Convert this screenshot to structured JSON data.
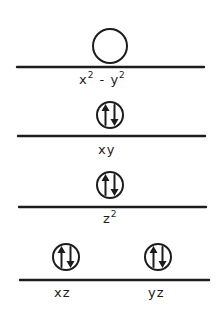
{
  "diagram": {
    "type": "d-orbital energy level diagram",
    "levels": [
      {
        "id": "x2-y2",
        "label_base_x": "x",
        "label_sup_x": "2",
        "label_minus": " - ",
        "label_base_y": "y",
        "label_sup_y": "2",
        "electrons": 0,
        "occupancy": "empty"
      },
      {
        "id": "xy",
        "label": "xy",
        "electrons": 2,
        "occupancy": "paired"
      },
      {
        "id": "z2",
        "label_base": "z",
        "label_sup": "2",
        "electrons": 2,
        "occupancy": "paired"
      },
      {
        "id": "xz",
        "label": "xz",
        "electrons": 2,
        "occupancy": "paired"
      },
      {
        "id": "yz",
        "label": "yz",
        "electrons": 2,
        "occupancy": "paired"
      }
    ],
    "colors": {
      "ink": "#1c1c1c",
      "background": "#ffffff"
    }
  }
}
